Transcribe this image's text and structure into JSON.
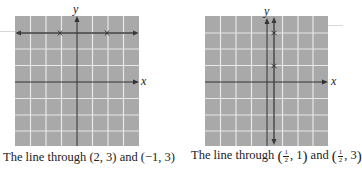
{
  "figures": [
    {
      "id": "left",
      "caption": {
        "prefix": "The line through ",
        "point1": "(2, 3)",
        "conj": " and ",
        "point2": "(−1, 3)"
      },
      "axis_labels": {
        "x": "x",
        "y": "y"
      },
      "line": {
        "type": "horizontal",
        "y": 3
      },
      "points": [
        {
          "x": 2,
          "y": 3
        },
        {
          "x": -1,
          "y": 3
        }
      ],
      "grid": {
        "xmin": -4,
        "xmax": 4,
        "ymin": -4,
        "ymax": 4
      }
    },
    {
      "id": "right",
      "caption": {
        "prefix": "The line through ",
        "p1_num": "1",
        "p1_den": "2",
        "p1_y": ", 1",
        "conj": " and ",
        "p2_num": "1",
        "p2_den": "2",
        "p2_y": ", 3"
      },
      "axis_labels": {
        "x": "x",
        "y": "y"
      },
      "line": {
        "type": "vertical",
        "x": 0.5
      },
      "points": [
        {
          "x": 0.5,
          "y": 1
        },
        {
          "x": 0.5,
          "y": 3
        }
      ],
      "grid": {
        "xmin": -4,
        "xmax": 4,
        "ymin": -4,
        "ymax": 4
      }
    }
  ],
  "colors": {
    "grid_bg": "#a9a9a9",
    "grid_lines": "#e6e6e6",
    "axes": "#333333",
    "plotted_line": "#3a3a3a"
  }
}
